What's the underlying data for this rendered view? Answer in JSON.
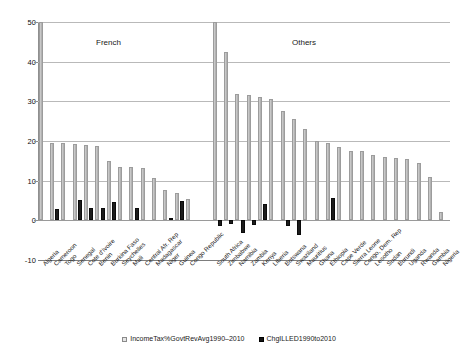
{
  "chart_data": {
    "type": "bar",
    "title": "",
    "xlabel": "",
    "ylabel": "",
    "ylim": [
      -10,
      50
    ],
    "yticks": [
      -10,
      0,
      10,
      20,
      30,
      40,
      50
    ],
    "ytick_labels": [
      "-10",
      "0",
      "10",
      "20",
      "30",
      "40",
      "50"
    ],
    "grid": true,
    "legend_position": "bottom",
    "annotations": [
      {
        "text": "French",
        "group": "french"
      },
      {
        "text": "Others",
        "group": "others"
      }
    ],
    "series": [
      {
        "name": "IncomeTax%GovtRevAvg1990-2010",
        "color": "#c2c2c2"
      },
      {
        "name": "ChgILLED1990to2010",
        "color": "#1c1c1c"
      }
    ],
    "groups": [
      {
        "name": "French",
        "categories": [
          "Algeria",
          "Cameroon",
          "Togo",
          "Senegal",
          "Cote d'Ivoire",
          "Benin",
          "Burkina Faso",
          "Seychelles",
          "Mali",
          "Central Afr. Rep",
          "Madagascar",
          "Niger",
          "Guinea",
          "Congo Republic"
        ],
        "IncomeTax%GovtRevAvg1990-2010": [
          50.0,
          19.5,
          19.4,
          19.3,
          19.0,
          18.8,
          15.0,
          13.5,
          13.4,
          13.3,
          10.6,
          7.6,
          6.8,
          5.3
        ],
        "ChgILLED1990to2010": [
          0.0,
          2.8,
          0.0,
          5.2,
          3.1,
          3.2,
          4.7,
          0.0,
          3.0,
          0.0,
          0.0,
          0.6,
          5.0,
          0.0
        ]
      },
      {
        "name": "Others",
        "categories": [
          "South Africa",
          "Zimbabwe",
          "Namibia",
          "Zambia",
          "Kenya",
          "Liberia",
          "Botswana",
          "Swaziland",
          "Mauritius",
          "Ghana",
          "Ethiopia",
          "Cape Verde",
          "Sierra Leone",
          "Congo, Dem. Rep",
          "Lesotho",
          "Sudan",
          "Burundi",
          "Uganda",
          "Rwanda",
          "Gambia",
          "Nigeria"
        ],
        "IncomeTax%GovtRevAvg1990-2010": [
          50.0,
          42.5,
          31.8,
          31.5,
          31.2,
          30.6,
          27.5,
          25.5,
          23.0,
          19.9,
          19.6,
          18.5,
          17.5,
          17.4,
          16.4,
          16.0,
          15.8,
          15.5,
          14.4,
          11.0,
          2.0
        ],
        "ChgILLED1990to2010": [
          -1.5,
          -0.8,
          -3.2,
          -1.2,
          4.0,
          0.0,
          -1.4,
          -3.8,
          0.0,
          0.0,
          5.6,
          0.0,
          0.0,
          0.0,
          0.0,
          0.0,
          0.0,
          0.0,
          0.0,
          0.0,
          0.0
        ]
      }
    ]
  },
  "legend": {
    "items": [
      {
        "label": "IncomeTax%GovtRevAvg1990–2010",
        "swatch": "light-square-icon"
      },
      {
        "label": "ChgILLED1990to2010",
        "swatch": "dark-square-icon"
      }
    ]
  },
  "sections": {
    "french_label": "French",
    "others_label": "Others"
  }
}
